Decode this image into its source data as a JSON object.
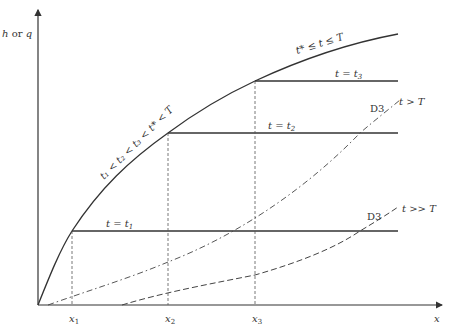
{
  "diagram": {
    "axes": {
      "y_label": "h or q",
      "x_label": "x",
      "x_ticks": [
        {
          "label": "x",
          "sub": "1"
        },
        {
          "label": "x",
          "sub": "2"
        },
        {
          "label": "x",
          "sub": "3"
        }
      ]
    },
    "curves": {
      "envelope_lower_label": "t₁ < t₂ < t₃ < t* < T",
      "envelope_upper_label": "t* ≤ t ≤ T",
      "dash_dot": {
        "tag": "D3",
        "condition": "t > T"
      },
      "dashed": {
        "tag": "D3",
        "condition": "t >> T"
      }
    },
    "levels": [
      {
        "label": "t = t₁"
      },
      {
        "label": "t = t₂"
      },
      {
        "label": "t = t₃"
      }
    ],
    "colors": {
      "line": "#333333",
      "guide": "#555555"
    }
  }
}
